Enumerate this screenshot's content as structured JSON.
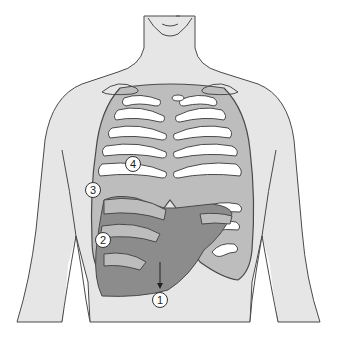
{
  "figure": {
    "colors": {
      "skin": "#e6e6e6",
      "outline": "#4a4a4a",
      "rib": "#bdbdbd",
      "liver": "#8c8c8c",
      "background": "#ffffff",
      "callout_fill": "#ffffff"
    },
    "callouts": [
      {
        "id": "1",
        "label": "1",
        "x": 160,
        "y": 300
      },
      {
        "id": "2",
        "label": "2",
        "x": 103,
        "y": 240
      },
      {
        "id": "3",
        "label": "3",
        "x": 93,
        "y": 190
      },
      {
        "id": "4",
        "label": "4",
        "x": 133,
        "y": 164
      }
    ]
  }
}
